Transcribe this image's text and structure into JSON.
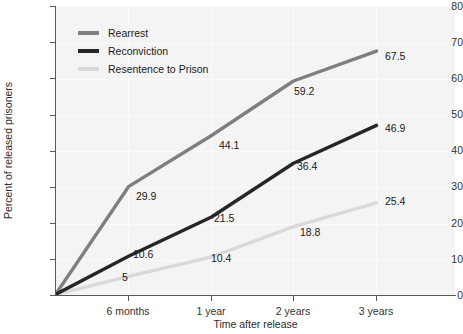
{
  "chart_data": {
    "type": "line",
    "title": "",
    "xlabel": "Time after release",
    "ylabel": "Percent of released prisoners",
    "categories": [
      "release",
      "6 months",
      "1 year",
      "2 years",
      "3 years"
    ],
    "xtick_labels": [
      "6 months",
      "1 year",
      "2 years",
      "3 years"
    ],
    "ytick_labels": [
      "0",
      "10",
      "20",
      "30",
      "40",
      "50",
      "60",
      "70",
      "80"
    ],
    "ylim": [
      0,
      80
    ],
    "grid": true,
    "legend_position": "upper-left-inside",
    "series": [
      {
        "name": "Rearrest",
        "color": "#7f7f7f",
        "values": [
          0,
          29.9,
          44.1,
          59.2,
          67.5
        ],
        "labels": [
          "",
          "29.9",
          "44.1",
          "59.2",
          "67.5"
        ]
      },
      {
        "name": "Reconviction",
        "color": "#262626",
        "values": [
          0,
          10.6,
          21.5,
          36.4,
          46.9
        ],
        "labels": [
          "",
          "10.6",
          "21.5",
          "36.4",
          "46.9"
        ]
      },
      {
        "name": "Resentence to Prison",
        "color": "#d9d9d9",
        "values": [
          0,
          5,
          10.4,
          18.8,
          25.4
        ],
        "labels": [
          "",
          "5",
          "10.4",
          "18.8",
          "25.4"
        ]
      }
    ]
  },
  "legend": {
    "items": [
      {
        "label": "Rearrest",
        "color": "#7f7f7f"
      },
      {
        "label": "Reconviction",
        "color": "#262626"
      },
      {
        "label": "Resentence to Prison",
        "color": "#d9d9d9"
      }
    ]
  },
  "axes": {
    "y_title": "Percent of released prisoners",
    "x_title": "Time after release",
    "y_ticks": [
      "80",
      "70",
      "60",
      "50",
      "40",
      "30",
      "20",
      "10",
      "0"
    ],
    "x_ticks": [
      "6 months",
      "1 year",
      "2 years",
      "3 years"
    ]
  },
  "point_labels": [
    {
      "text": "67.5",
      "series": "Rearrest"
    },
    {
      "text": "59.2",
      "series": "Rearrest"
    },
    {
      "text": "44.1",
      "series": "Rearrest"
    },
    {
      "text": "29.9",
      "series": "Rearrest"
    },
    {
      "text": "46.9",
      "series": "Reconviction"
    },
    {
      "text": "36.4",
      "series": "Reconviction"
    },
    {
      "text": "21.5",
      "series": "Reconviction"
    },
    {
      "text": "10.6",
      "series": "Reconviction"
    },
    {
      "text": "25.4",
      "series": "Resentence to Prison"
    },
    {
      "text": "18.8",
      "series": "Resentence to Prison"
    },
    {
      "text": "10.4",
      "series": "Resentence to Prison"
    },
    {
      "text": "5",
      "series": "Resentence to Prison"
    }
  ]
}
